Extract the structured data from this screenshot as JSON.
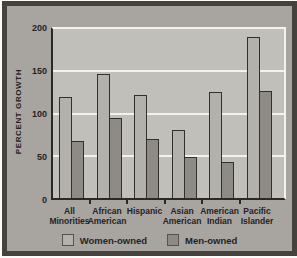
{
  "chart_data": {
    "type": "bar",
    "title": "",
    "ylabel": "PERCENT GROWTH",
    "xlabel": "",
    "categories": [
      "All Minorities",
      "African American",
      "Hispanic",
      "Asian American",
      "American Indian",
      "Pacific Islander"
    ],
    "category_lines": [
      [
        "All",
        "Minorities"
      ],
      [
        "African",
        "American"
      ],
      [
        "Hispanic"
      ],
      [
        "Asian",
        "American"
      ],
      [
        "American",
        "Indian"
      ],
      [
        "Pacific",
        "Islander"
      ]
    ],
    "series": [
      {
        "name": "Women-owned",
        "values": [
          120,
          147,
          122,
          81,
          125,
          191
        ],
        "color": "#b3b1ac"
      },
      {
        "name": "Men-owned",
        "values": [
          67,
          95,
          70,
          48,
          43,
          127
        ],
        "color": "#8e8b86"
      }
    ],
    "yticks": [
      0,
      50,
      100,
      150,
      200
    ],
    "ylim": [
      0,
      200
    ],
    "grid": true,
    "legend_position": "bottom"
  },
  "colors": {
    "figure_background": "#a8a5a1",
    "plot_background": "#c1bfba",
    "gridline": "#f3f2ef",
    "axis": "#2b2925",
    "bar_outline": "#32302c",
    "frame_border": "#45423e",
    "text": "#25231f",
    "page": "#fbfbf9"
  }
}
